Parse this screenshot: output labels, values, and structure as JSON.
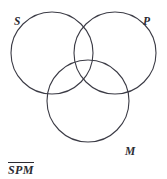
{
  "figure": {
    "type": "venn-diagram",
    "background_color": "#ffffff",
    "stroke_color": "#3c3c46",
    "text_color": "#2b2b32",
    "width": 167,
    "height": 179,
    "circles": [
      {
        "id": "S",
        "cx": 52,
        "cy": 53,
        "r": 41
      },
      {
        "id": "P",
        "cx": 115,
        "cy": 53,
        "r": 41
      },
      {
        "id": "M",
        "cx": 88,
        "cy": 101,
        "r": 41
      }
    ],
    "labels": {
      "set_s": "S",
      "set_p": "P",
      "set_m": "M"
    },
    "caption": {
      "text": "SPM",
      "overline": true
    }
  }
}
